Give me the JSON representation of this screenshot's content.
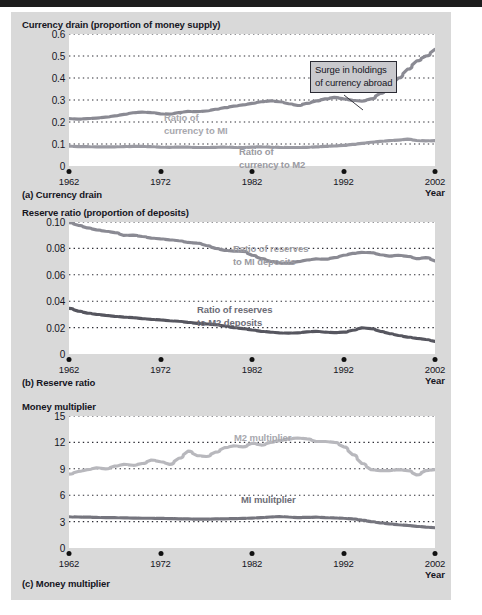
{
  "figure": {
    "background_color": "#d9d9d9",
    "panels": [
      {
        "id": "a",
        "axis_title": "Currency drain (proportion of money supply)",
        "caption": "(a) Currency drain",
        "x_axis_word": "Year"
      },
      {
        "id": "b",
        "axis_title": "Reserve ratio (proportion of deposits)",
        "caption": "(b) Reserve ratio",
        "x_axis_word": "Year"
      },
      {
        "id": "c",
        "axis_title": "Money multiplier",
        "caption": "(c) Money multiplier",
        "x_axis_word": "Year"
      }
    ]
  },
  "annotations": {
    "surge_callout": {
      "line1": "Surge in holdings",
      "line2": "of currency abroad"
    }
  },
  "chart_data": [
    {
      "type": "line",
      "id": "a",
      "title": "Currency drain (proportion of money supply)",
      "caption": "(a) Currency drain",
      "xlabel": "Year",
      "ylabel": "Currency drain (proportion of money supply)",
      "xlim": [
        1962,
        2002
      ],
      "ylim": [
        0,
        0.6
      ],
      "xticks": [
        1962,
        1972,
        1982,
        1992,
        2002
      ],
      "xticklabels": [
        "1962",
        "1972",
        "1982",
        "1992",
        "2002"
      ],
      "yticks": [
        0,
        0.1,
        0.2,
        0.3,
        0.4,
        0.5,
        0.6
      ],
      "yticklabels": [
        "0",
        "0.1",
        "0.2",
        "0.3",
        "0.4",
        "0.5",
        "0.6"
      ],
      "grid": "horizontal-dotted",
      "legend": "inline-labels",
      "annotations": [
        {
          "text": "Surge in holdings of currency abroad",
          "target_x": 1995,
          "target_y": 0.35
        }
      ],
      "series": [
        {
          "name": "Ratio of currency to MI",
          "label": "Ratio of\ncurrency to MI",
          "color": "#8a8a93",
          "x": [
            1962,
            1963,
            1964,
            1965,
            1966,
            1967,
            1968,
            1969,
            1970,
            1971,
            1972,
            1973,
            1974,
            1975,
            1976,
            1977,
            1978,
            1979,
            1980,
            1981,
            1982,
            1983,
            1984,
            1985,
            1986,
            1987,
            1988,
            1989,
            1990,
            1991,
            1992,
            1993,
            1994,
            1995,
            1996,
            1997,
            1998,
            1999,
            2000,
            2001,
            2002
          ],
          "values": [
            0.215,
            0.213,
            0.215,
            0.218,
            0.222,
            0.228,
            0.235,
            0.242,
            0.245,
            0.243,
            0.237,
            0.236,
            0.243,
            0.248,
            0.247,
            0.25,
            0.258,
            0.265,
            0.272,
            0.278,
            0.285,
            0.292,
            0.296,
            0.292,
            0.283,
            0.275,
            0.285,
            0.296,
            0.305,
            0.312,
            0.305,
            0.298,
            0.295,
            0.305,
            0.33,
            0.362,
            0.4,
            0.44,
            0.478,
            0.5,
            0.53
          ]
        },
        {
          "name": "Ratio of currency to M2",
          "label": "Ratio of\ncurrency to M2",
          "color": "#9a9aa2",
          "x": [
            1962,
            1963,
            1964,
            1965,
            1966,
            1967,
            1968,
            1969,
            1970,
            1971,
            1972,
            1973,
            1974,
            1975,
            1976,
            1977,
            1978,
            1979,
            1980,
            1981,
            1982,
            1983,
            1984,
            1985,
            1986,
            1987,
            1988,
            1989,
            1990,
            1991,
            1992,
            1993,
            1994,
            1995,
            1996,
            1997,
            1998,
            1999,
            2000,
            2001,
            2002
          ],
          "values": [
            0.09,
            0.088,
            0.088,
            0.087,
            0.087,
            0.087,
            0.088,
            0.089,
            0.089,
            0.088,
            0.086,
            0.085,
            0.086,
            0.086,
            0.084,
            0.084,
            0.085,
            0.086,
            0.085,
            0.084,
            0.086,
            0.087,
            0.086,
            0.085,
            0.084,
            0.084,
            0.085,
            0.087,
            0.089,
            0.091,
            0.094,
            0.098,
            0.103,
            0.108,
            0.112,
            0.115,
            0.118,
            0.122,
            0.116,
            0.114,
            0.115
          ]
        }
      ]
    },
    {
      "type": "line",
      "id": "b",
      "title": "Reserve ratio (proportion of deposits)",
      "caption": "(b) Reserve ratio",
      "xlabel": "Year",
      "ylabel": "Reserve ratio (proportion of deposits)",
      "xlim": [
        1962,
        2002
      ],
      "ylim": [
        0,
        0.1
      ],
      "xticks": [
        1962,
        1972,
        1982,
        1992,
        2002
      ],
      "xticklabels": [
        "1962",
        "1972",
        "1982",
        "1992",
        "2002"
      ],
      "yticks": [
        0,
        0.02,
        0.04,
        0.06,
        0.08,
        0.1
      ],
      "yticklabels": [
        "0",
        "0.02",
        "0.04",
        "0.06",
        "0.08",
        "0.10"
      ],
      "grid": "horizontal-dotted",
      "legend": "inline-labels",
      "series": [
        {
          "name": "Ratio of reserves to MI deposits",
          "label": "Ratio of reserves\nto MI deposits",
          "color": "#8a8a93",
          "x": [
            1962,
            1963,
            1964,
            1965,
            1966,
            1967,
            1968,
            1969,
            1970,
            1971,
            1972,
            1973,
            1974,
            1975,
            1976,
            1977,
            1978,
            1979,
            1980,
            1981,
            1982,
            1983,
            1984,
            1985,
            1986,
            1987,
            1988,
            1989,
            1990,
            1991,
            1992,
            1993,
            1994,
            1995,
            1996,
            1997,
            1998,
            1999,
            2000,
            2001,
            2002
          ],
          "values": [
            0.0995,
            0.0975,
            0.0955,
            0.094,
            0.093,
            0.092,
            0.0898,
            0.09,
            0.089,
            0.0878,
            0.0872,
            0.0865,
            0.0858,
            0.0845,
            0.084,
            0.0822,
            0.08,
            0.0785,
            0.078,
            0.0778,
            0.0748,
            0.0722,
            0.0702,
            0.069,
            0.0688,
            0.07,
            0.0712,
            0.072,
            0.0718,
            0.073,
            0.0748,
            0.0762,
            0.077,
            0.0768,
            0.0752,
            0.0742,
            0.0748,
            0.074,
            0.0722,
            0.073,
            0.0705
          ]
        },
        {
          "name": "Ratio of reserves to M2 deposits",
          "label": "Ratio of reserves\nto M2 deposits",
          "color": "#56565f",
          "x": [
            1962,
            1963,
            1964,
            1965,
            1966,
            1967,
            1968,
            1969,
            1970,
            1971,
            1972,
            1973,
            1974,
            1975,
            1976,
            1977,
            1978,
            1979,
            1980,
            1981,
            1982,
            1983,
            1984,
            1985,
            1986,
            1987,
            1988,
            1989,
            1990,
            1991,
            1992,
            1993,
            1994,
            1995,
            1996,
            1997,
            1998,
            1999,
            2000,
            2001,
            2002
          ],
          "values": [
            0.0345,
            0.0325,
            0.031,
            0.03,
            0.0292,
            0.0285,
            0.028,
            0.0275,
            0.0268,
            0.0262,
            0.0258,
            0.0252,
            0.0248,
            0.024,
            0.0232,
            0.0228,
            0.0222,
            0.0212,
            0.02,
            0.0192,
            0.0182,
            0.0172,
            0.0166,
            0.016,
            0.0158,
            0.016,
            0.0168,
            0.0172,
            0.0165,
            0.0162,
            0.0165,
            0.018,
            0.0198,
            0.0192,
            0.0172,
            0.0155,
            0.014,
            0.0128,
            0.0118,
            0.011,
            0.0095
          ]
        }
      ]
    },
    {
      "type": "line",
      "id": "c",
      "title": "Money multiplier",
      "caption": "(c) Money multiplier",
      "xlabel": "Year",
      "ylabel": "Money multiplier",
      "xlim": [
        1962,
        2002
      ],
      "ylim": [
        0,
        15
      ],
      "xticks": [
        1962,
        1972,
        1982,
        1992,
        2002
      ],
      "xticklabels": [
        "1962",
        "1972",
        "1982",
        "1992",
        "2002"
      ],
      "yticks": [
        0,
        3,
        6,
        9,
        12,
        15
      ],
      "yticklabels": [
        "0",
        "3",
        "6",
        "9",
        "12",
        "15"
      ],
      "grid": "horizontal-dotted",
      "legend": "inline-labels",
      "series": [
        {
          "name": "M2 multiplier",
          "label": "M2 multiplier",
          "color": "#b8b8bd",
          "x": [
            1962,
            1963,
            1964,
            1965,
            1966,
            1967,
            1968,
            1969,
            1970,
            1971,
            1972,
            1973,
            1974,
            1975,
            1976,
            1977,
            1978,
            1979,
            1980,
            1981,
            1982,
            1983,
            1984,
            1985,
            1986,
            1987,
            1988,
            1989,
            1990,
            1991,
            1992,
            1993,
            1994,
            1995,
            1996,
            1997,
            1998,
            1999,
            2000,
            2001,
            2002
          ],
          "values": [
            8.4,
            8.7,
            8.9,
            9.1,
            9.0,
            9.3,
            9.5,
            9.4,
            9.6,
            10.0,
            9.8,
            9.5,
            10.2,
            11.0,
            10.5,
            10.4,
            10.9,
            11.4,
            11.6,
            11.5,
            11.9,
            11.7,
            12.0,
            12.2,
            12.4,
            12.5,
            12.4,
            12.1,
            12.1,
            12.0,
            11.5,
            10.6,
            9.6,
            8.9,
            8.8,
            8.8,
            8.9,
            8.8,
            8.3,
            8.8,
            8.9
          ]
        },
        {
          "name": "MI mulitplier",
          "label": "MI mulitplier",
          "color": "#75757e",
          "x": [
            1962,
            1963,
            1964,
            1965,
            1966,
            1967,
            1968,
            1969,
            1970,
            1971,
            1972,
            1973,
            1974,
            1975,
            1976,
            1977,
            1978,
            1979,
            1980,
            1981,
            1982,
            1983,
            1984,
            1985,
            1986,
            1987,
            1988,
            1989,
            1990,
            1991,
            1992,
            1993,
            1994,
            1995,
            1996,
            1997,
            1998,
            1999,
            2000,
            2001,
            2002
          ],
          "values": [
            3.55,
            3.52,
            3.5,
            3.48,
            3.45,
            3.45,
            3.42,
            3.4,
            3.38,
            3.38,
            3.36,
            3.34,
            3.32,
            3.3,
            3.28,
            3.28,
            3.3,
            3.32,
            3.34,
            3.36,
            3.4,
            3.46,
            3.52,
            3.58,
            3.52,
            3.46,
            3.48,
            3.5,
            3.46,
            3.42,
            3.38,
            3.3,
            3.16,
            3.0,
            2.86,
            2.74,
            2.64,
            2.56,
            2.46,
            2.38,
            2.3
          ]
        }
      ]
    }
  ]
}
